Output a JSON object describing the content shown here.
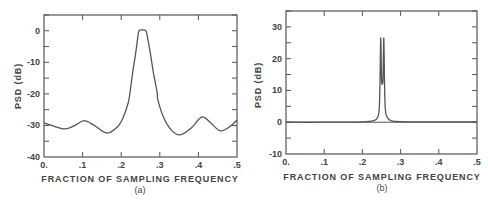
{
  "chart_data": [
    {
      "type": "line",
      "panel": "a",
      "caption": "(a)",
      "title": "",
      "xlabel": "FRACTION OF SAMPLING FREQUENCY",
      "ylabel": "PSD (dB)",
      "xlim": [
        0,
        0.5
      ],
      "ylim": [
        -40,
        5
      ],
      "xticks": [
        0,
        0.1,
        0.2,
        0.3,
        0.4,
        0.5
      ],
      "xtick_labels": [
        "0.",
        ".1",
        ".2",
        ".3",
        ".4",
        ".5"
      ],
      "yticks": [
        0,
        -10,
        -20,
        -30,
        -40
      ],
      "ytick_labels": [
        "0",
        "-10",
        "-20",
        "-30",
        "-40"
      ],
      "yminor_step": 5,
      "grid": false,
      "legend": null,
      "series": [
        {
          "name": "PSD",
          "x": [
            0.0,
            0.02,
            0.054,
            0.08,
            0.104,
            0.13,
            0.163,
            0.19,
            0.205,
            0.218,
            0.223,
            0.23,
            0.238,
            0.243,
            0.246,
            0.255,
            0.264,
            0.268,
            0.275,
            0.283,
            0.293,
            0.295,
            0.31,
            0.33,
            0.352,
            0.38,
            0.409,
            0.43,
            0.456,
            0.48,
            0.5
          ],
          "y": [
            -29.2,
            -30.0,
            -31.1,
            -30.0,
            -28.5,
            -30.0,
            -32.4,
            -30.5,
            -27.5,
            -22.9,
            -19.4,
            -13.0,
            -6.7,
            -2.0,
            0.0,
            0.3,
            0.0,
            -2.0,
            -6.7,
            -13.0,
            -19.4,
            -21.9,
            -27.5,
            -31.5,
            -33.0,
            -31.0,
            -27.3,
            -29.0,
            -31.7,
            -30.5,
            -28.3
          ]
        }
      ]
    },
    {
      "type": "line",
      "panel": "b",
      "caption": "(b)",
      "title": "",
      "xlabel": "FRACTION OF SAMPLING FREQUENCY",
      "ylabel": "PSD (dB)",
      "xlim": [
        0,
        0.5
      ],
      "ylim": [
        -10,
        35
      ],
      "xticks": [
        0,
        0.1,
        0.2,
        0.3,
        0.4,
        0.5
      ],
      "xtick_labels": [
        "0.",
        ".1",
        ".2",
        ".3",
        ".4",
        ".5"
      ],
      "yticks": [
        30,
        20,
        10,
        0,
        -10
      ],
      "ytick_labels": [
        "30",
        "20",
        "10",
        "0",
        "-10"
      ],
      "yminor_step": 5,
      "zero_line": true,
      "grid": false,
      "legend": null,
      "series": [
        {
          "name": "PSD",
          "x": [
            0.0,
            0.1,
            0.2,
            0.23,
            0.24,
            0.244,
            0.246,
            0.248,
            0.25,
            0.252,
            0.254,
            0.256,
            0.258,
            0.26,
            0.265,
            0.275,
            0.3,
            0.4,
            0.5
          ],
          "y": [
            0.0,
            0.0,
            0.1,
            0.5,
            1.5,
            4.0,
            12.0,
            26.5,
            14.0,
            12.0,
            14.0,
            26.5,
            12.0,
            4.0,
            1.5,
            0.5,
            0.2,
            0.1,
            0.1
          ]
        }
      ]
    }
  ],
  "panels": {
    "a": {
      "caption": "(a)",
      "xlabel": "FRACTION OF SAMPLING FREQUENCY",
      "ylabel": "PSD (dB)"
    },
    "b": {
      "caption": "(b)",
      "xlabel": "FRACTION OF SAMPLING FREQUENCY",
      "ylabel": "PSD (dB)"
    }
  }
}
